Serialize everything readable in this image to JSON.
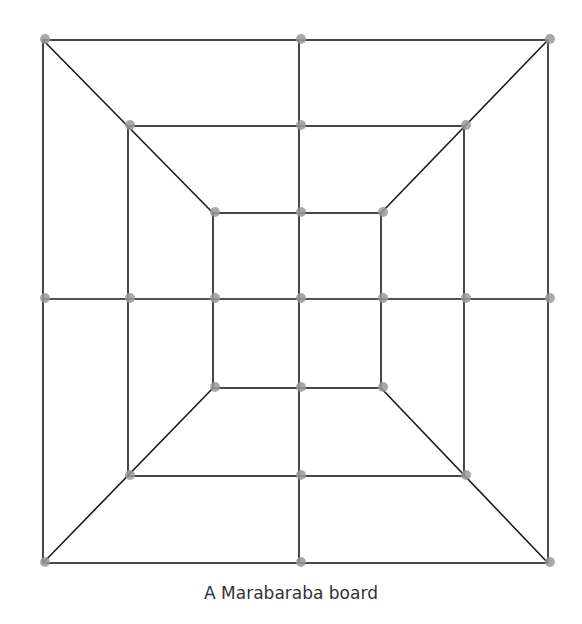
{
  "caption": "A Marabaraba board",
  "colors": {
    "line": "#1a1a1a",
    "point": "#9a9a9a",
    "background": "#ffffff"
  },
  "board": {
    "squares": [
      {
        "name": "outer",
        "x1": 43,
        "y1": 40,
        "x2": 548,
        "y2": 563
      },
      {
        "name": "middle",
        "x1": 128,
        "y1": 126,
        "x2": 464,
        "y2": 476
      },
      {
        "name": "inner",
        "x1": 213,
        "y1": 213,
        "x2": 381,
        "y2": 388
      }
    ],
    "center": {
      "x": 299,
      "y": 299
    },
    "point_radius": 5
  }
}
